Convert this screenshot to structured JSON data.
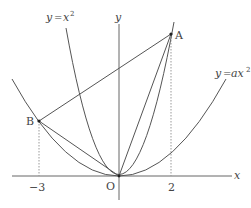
{
  "diagram": {
    "axes": {
      "x_label": "x",
      "y_label": "y",
      "origin_label": "O"
    },
    "ticks": {
      "left": "−3",
      "right": "2"
    },
    "curves": [
      {
        "name": "steep-parabola",
        "equation_y": "y",
        "equation_eq": "=",
        "equation_x": "x",
        "equation_exp": "2"
      },
      {
        "name": "wide-parabola",
        "equation_y": "y",
        "equation_eq": "=",
        "equation_x": "ax",
        "equation_exp": "2"
      }
    ],
    "points": {
      "A": {
        "label": "A",
        "x": 2,
        "y": 4
      },
      "B": {
        "label": "B",
        "x": -3
      }
    },
    "segments": [
      "OA",
      "OB",
      "AB"
    ],
    "colors": {
      "line": "#555555",
      "dotted": "#888888",
      "text": "#444444"
    }
  }
}
